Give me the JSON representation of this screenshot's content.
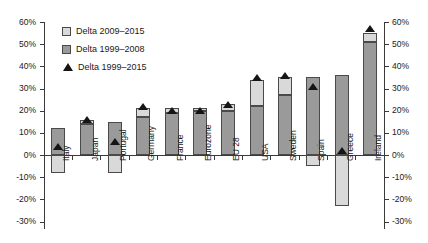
{
  "chart_data": {
    "type": "bar",
    "title": "",
    "subtitle": "",
    "xlabel": "",
    "ylabel": "",
    "ylim": [
      -30,
      60
    ],
    "ytick_labels": [
      "60%",
      "50%",
      "40%",
      "30%",
      "20%",
      "10%",
      "0%",
      "-10%",
      "-20%",
      "-30%"
    ],
    "ytick_values": [
      60,
      50,
      40,
      30,
      20,
      10,
      0,
      -10,
      -20,
      -30
    ],
    "grid": false,
    "legend_position": "upper-left",
    "stacked": true,
    "dual_axis": true,
    "categories": [
      "Italy",
      "Japan",
      "Portugal",
      "Germany",
      "France",
      "Eurozone",
      "EU 28",
      "USA",
      "Sweden",
      "Spain",
      "Greece",
      "Ireland"
    ],
    "series": [
      {
        "name": "Delta 1999–2008",
        "key": "delta_1999_2008",
        "color": "#9a9a9a",
        "values": [
          12,
          14,
          15,
          17,
          19,
          20,
          20,
          22,
          27,
          35,
          36,
          51
        ]
      },
      {
        "name": "Delta 2009–2015",
        "key": "delta_2009_2015",
        "color": "#d9d9d9",
        "values": [
          -8,
          2,
          -8,
          4,
          2,
          1,
          3,
          12,
          8,
          -5,
          -23,
          4
        ]
      },
      {
        "name": "Delta 1999–2015",
        "key": "delta_1999_2015",
        "color": "#151515",
        "marker": "triangle",
        "values": [
          4,
          16,
          6,
          22,
          20,
          20,
          23,
          35,
          36,
          31,
          2,
          57
        ]
      }
    ],
    "legend_entries": [
      {
        "label": "Delta 2009–2015",
        "marker": "swatch-light"
      },
      {
        "label": "Delta 1999–2008",
        "marker": "swatch-dark"
      },
      {
        "label": "Delta 1999–2015",
        "marker": "triangle"
      }
    ]
  }
}
